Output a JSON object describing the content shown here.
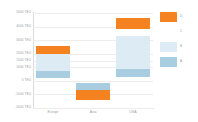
{
  "chart_data": {
    "type": "bar",
    "title": "",
    "subtitle": "",
    "xlabel": "",
    "ylabel": "",
    "categories": [
      "Europe",
      "Asia",
      "USA"
    ],
    "ylim": [
      -2000,
      5000
    ],
    "y_unit": "TEU",
    "grid": true,
    "legend_position": "right",
    "yticks": [
      {
        "value": 5000,
        "label": "5000 TEU"
      },
      {
        "value": 4000,
        "label": "4000 TEU"
      },
      {
        "value": 3000,
        "label": "3000 TEU"
      },
      {
        "value": 2000,
        "label": "2000 TEU"
      },
      {
        "value": 1500,
        "label": "1500 TEU"
      },
      {
        "value": 1000,
        "label": "1000 TEU"
      },
      {
        "value": 0,
        "label": "0 TEU"
      },
      {
        "value": -1000,
        "label": "-1000 TEU"
      },
      {
        "value": -2000,
        "label": "-2000 TEU"
      }
    ],
    "series": [
      {
        "name": "D",
        "color": "#f58220",
        "segments": [
          {
            "category": "Europe",
            "low": 2000,
            "high": 2600
          },
          {
            "category": "Asia",
            "low": -1400,
            "high": -700
          },
          {
            "category": "USA",
            "low": 3800,
            "high": 4600
          }
        ]
      },
      {
        "name": "C",
        "color": "#ffffff",
        "segments": []
      },
      {
        "name": "B",
        "color": "#dcebf4",
        "segments": [
          {
            "category": "Europe",
            "low": 700,
            "high": 2000
          },
          {
            "category": "Asia",
            "low": -700,
            "high": -150
          },
          {
            "category": "USA",
            "low": 900,
            "high": 3300
          }
        ]
      },
      {
        "name": "A",
        "color": "#a9cde0",
        "segments": [
          {
            "category": "Europe",
            "low": 200,
            "high": 700
          },
          {
            "category": "Asia",
            "low": -700,
            "high": -150
          },
          {
            "category": "USA",
            "low": 300,
            "high": 900
          }
        ]
      }
    ]
  },
  "legend": {
    "items": [
      {
        "label": "D",
        "color": "#f58220",
        "swatch": "orange"
      },
      {
        "label": "C",
        "color": "#ffffff",
        "swatch": "blank"
      },
      {
        "label": "B",
        "color": "#dcebf4",
        "swatch": "pale"
      },
      {
        "label": "A",
        "color": "#a9cde0",
        "swatch": "mid"
      }
    ]
  }
}
